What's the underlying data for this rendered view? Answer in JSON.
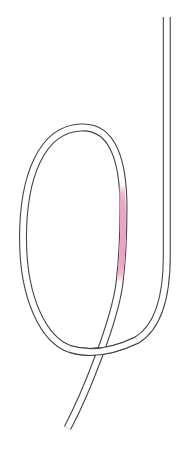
{
  "figure": {
    "type": "knot-illustration",
    "colors": {
      "background": "#ffffff",
      "rope_outline": "#454545",
      "rope_fill": "#ffffff",
      "highlight_pink": "#efa3c4"
    }
  }
}
